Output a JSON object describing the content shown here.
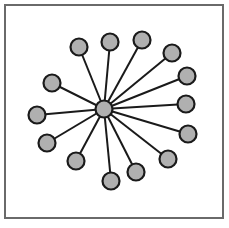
{
  "diagram": {
    "type": "star-graph",
    "colors": {
      "frame_border": "#6a6a6a",
      "node_fill": "#b0b0b0",
      "node_stroke": "#1a1a1a",
      "edge": "#1a1a1a",
      "background": "#ffffff"
    },
    "node_radius": 8.5,
    "hub": {
      "id": "hub",
      "x": 104,
      "y": 109
    },
    "leaves": [
      {
        "id": "n1",
        "x": 79,
        "y": 47
      },
      {
        "id": "n2",
        "x": 110,
        "y": 42
      },
      {
        "id": "n3",
        "x": 142,
        "y": 40
      },
      {
        "id": "n4",
        "x": 172,
        "y": 53
      },
      {
        "id": "n5",
        "x": 187,
        "y": 76
      },
      {
        "id": "n6",
        "x": 186,
        "y": 104
      },
      {
        "id": "n7",
        "x": 188,
        "y": 134
      },
      {
        "id": "n8",
        "x": 168,
        "y": 159
      },
      {
        "id": "n9",
        "x": 136,
        "y": 172
      },
      {
        "id": "n10",
        "x": 111,
        "y": 181
      },
      {
        "id": "n11",
        "x": 76,
        "y": 161
      },
      {
        "id": "n12",
        "x": 47,
        "y": 143
      },
      {
        "id": "n13",
        "x": 37,
        "y": 115
      },
      {
        "id": "n14",
        "x": 52,
        "y": 83
      }
    ]
  }
}
